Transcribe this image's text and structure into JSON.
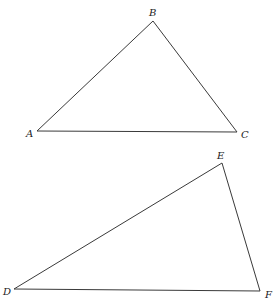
{
  "figure": {
    "width": 275,
    "height": 306,
    "stroke_color": "#3a3a3a",
    "label_color": "#222222",
    "background": "#ffffff"
  },
  "triangles": [
    {
      "name": "ABC",
      "vertices": [
        {
          "label": "A",
          "x": 37,
          "y": 131,
          "label_x": 26,
          "label_y": 137
        },
        {
          "label": "B",
          "x": 153,
          "y": 21,
          "label_x": 149,
          "label_y": 16
        },
        {
          "label": "C",
          "x": 237,
          "y": 132,
          "label_x": 241,
          "label_y": 138
        }
      ]
    },
    {
      "name": "DEF",
      "vertices": [
        {
          "label": "D",
          "x": 14,
          "y": 289,
          "label_x": 3,
          "label_y": 295
        },
        {
          "label": "E",
          "x": 222,
          "y": 163,
          "label_x": 217,
          "label_y": 159
        },
        {
          "label": "F",
          "x": 260,
          "y": 291,
          "label_x": 265,
          "label_y": 298
        }
      ]
    }
  ]
}
